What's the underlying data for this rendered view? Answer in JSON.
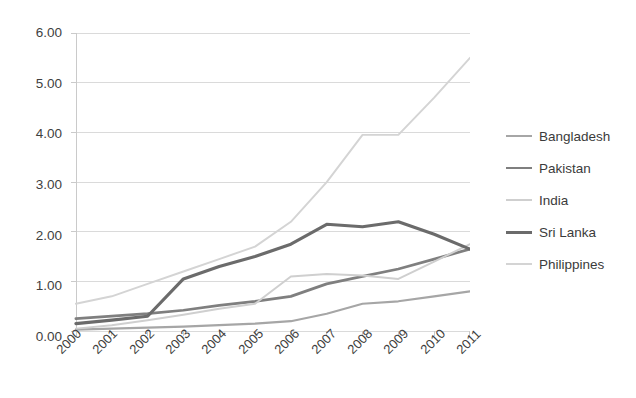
{
  "chart_data": {
    "type": "line",
    "title": "",
    "xlabel": "",
    "ylabel": "",
    "categories": [
      "2000",
      "2001",
      "2002",
      "2003",
      "2004",
      "2005",
      "2006",
      "2007",
      "2008",
      "2009",
      "2010",
      "2011"
    ],
    "ylim": [
      0.0,
      6.0
    ],
    "ytick_step": 1.0,
    "ytick_labels": [
      "0.00",
      "1.00",
      "2.00",
      "3.00",
      "4.00",
      "5.00",
      "6.00"
    ],
    "ytick_values": [
      0.0,
      1.0,
      2.0,
      3.0,
      4.0,
      5.0,
      6.0
    ],
    "grid": "horizontal",
    "legend_position": "right",
    "series": [
      {
        "name": "Bangladesh",
        "color": "#a6a6a6",
        "width": 2.2,
        "values": [
          0.03,
          0.05,
          0.07,
          0.09,
          0.12,
          0.15,
          0.2,
          0.35,
          0.55,
          0.6,
          0.7,
          0.8
        ]
      },
      {
        "name": "Pakistan",
        "color": "#7f7f7f",
        "width": 2.8,
        "values": [
          0.25,
          0.3,
          0.35,
          0.42,
          0.52,
          0.6,
          0.7,
          0.95,
          1.1,
          1.25,
          1.45,
          1.65
        ]
      },
      {
        "name": "India",
        "color": "#cfcfcf",
        "width": 2.0,
        "values": [
          0.05,
          0.12,
          0.22,
          0.33,
          0.45,
          0.55,
          1.1,
          1.15,
          1.12,
          1.05,
          1.4,
          1.75
        ]
      },
      {
        "name": "Sri Lanka",
        "color": "#6b6b6b",
        "width": 3.2,
        "values": [
          0.15,
          0.22,
          0.3,
          1.05,
          1.3,
          1.5,
          1.75,
          2.15,
          2.1,
          2.2,
          1.95,
          1.65
        ]
      },
      {
        "name": "Philippines",
        "color": "#d4d4d4",
        "width": 2.0,
        "values": [
          0.55,
          0.7,
          0.95,
          1.2,
          1.45,
          1.7,
          2.2,
          3.0,
          3.95,
          3.95,
          4.7,
          5.5
        ]
      }
    ]
  },
  "legend": {
    "items": [
      {
        "label": "Bangladesh"
      },
      {
        "label": "Pakistan"
      },
      {
        "label": "India"
      },
      {
        "label": "Sri Lanka"
      },
      {
        "label": "Philippines"
      }
    ]
  }
}
